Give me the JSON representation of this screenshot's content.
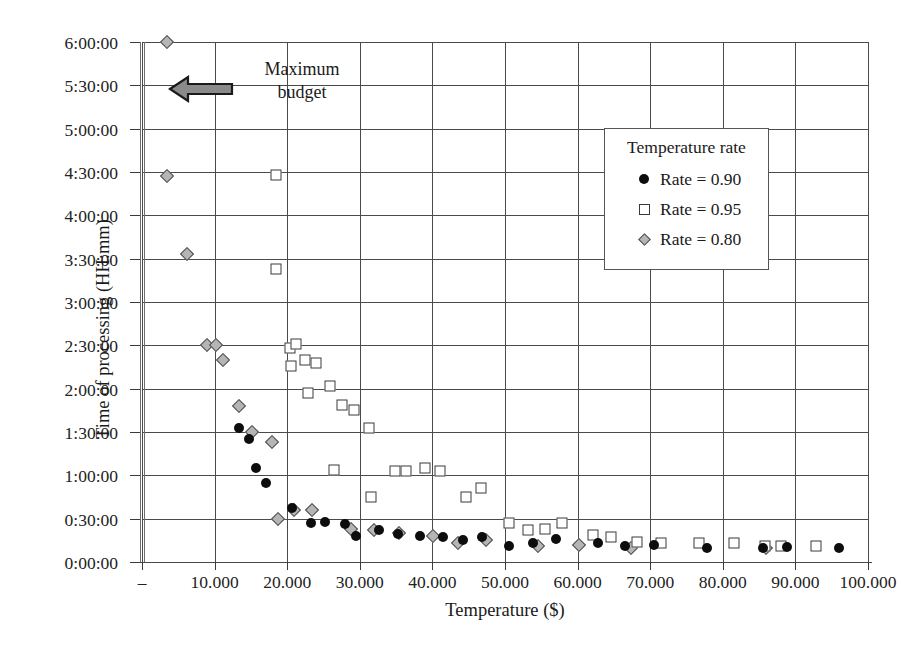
{
  "chart_data": {
    "type": "scatter",
    "title": "",
    "xlabel": "Temperature ($)",
    "ylabel": "Time of processing (HH:mm)",
    "xlim": [
      0,
      100000
    ],
    "ylim": [
      0,
      21600
    ],
    "grid": true,
    "legend_position": "inside-top-right",
    "legend_title": "Temperature rate",
    "x_ticks": [
      0,
      10000,
      20000,
      30000,
      40000,
      50000,
      60000,
      70000,
      80000,
      90000,
      100000
    ],
    "x_tick_labels": [
      "–",
      "10.000",
      "20.000",
      "30.000",
      "40.000",
      "50.000",
      "60.000",
      "70.000",
      "80.000",
      "90.000",
      "100.000"
    ],
    "y_ticks": [
      0,
      1800,
      3600,
      5400,
      7200,
      9000,
      10800,
      12600,
      14400,
      16200,
      18000,
      19800,
      21600
    ],
    "y_tick_labels": [
      "0:00:00",
      "0:30:00",
      "1:00:00",
      "1:30:00",
      "2:00:00",
      "2:30:00",
      "3:00:00",
      "3:30:00",
      "4:00:00",
      "4:30:00",
      "5:00:00",
      "5:30:00",
      "6:00:00"
    ],
    "annotations": [
      {
        "text": "Maximum\nbudget",
        "arrow": "left-arrow",
        "x": 12000,
        "y": 19800
      }
    ],
    "series": [
      {
        "name": "Rate = 0.90",
        "marker": "filled-circle",
        "color": "#0d0d0d",
        "points": [
          [
            13300,
            5580
          ],
          [
            14800,
            5100
          ],
          [
            15700,
            3900
          ],
          [
            17100,
            3300
          ],
          [
            20700,
            2250
          ],
          [
            23300,
            1620
          ],
          [
            25200,
            1680
          ],
          [
            28000,
            1560
          ],
          [
            29500,
            1080
          ],
          [
            32600,
            1320
          ],
          [
            35200,
            1170
          ],
          [
            38300,
            1080
          ],
          [
            41500,
            1020
          ],
          [
            44200,
            900
          ],
          [
            46800,
            1020
          ],
          [
            50500,
            660
          ],
          [
            53800,
            810
          ],
          [
            57000,
            960
          ],
          [
            62800,
            780
          ],
          [
            66500,
            660
          ],
          [
            70500,
            720
          ],
          [
            77800,
            570
          ],
          [
            85600,
            600
          ],
          [
            88800,
            630
          ],
          [
            96000,
            570
          ]
        ]
      },
      {
        "name": "Rate = 0.95",
        "marker": "open-square",
        "color": "#3a3a3a",
        "points": [
          [
            18500,
            16080
          ],
          [
            18500,
            12180
          ],
          [
            20400,
            8880
          ],
          [
            21200,
            9060
          ],
          [
            20500,
            8160
          ],
          [
            22400,
            8400
          ],
          [
            24000,
            8280
          ],
          [
            22800,
            7020
          ],
          [
            25900,
            7320
          ],
          [
            27600,
            6540
          ],
          [
            29200,
            6300
          ],
          [
            31300,
            5580
          ],
          [
            26400,
            3840
          ],
          [
            31500,
            2700
          ],
          [
            34800,
            3780
          ],
          [
            36300,
            3780
          ],
          [
            39000,
            3900
          ],
          [
            41000,
            3780
          ],
          [
            44600,
            2700
          ],
          [
            46700,
            3060
          ],
          [
            50600,
            1620
          ],
          [
            53200,
            1320
          ],
          [
            55500,
            1380
          ],
          [
            57900,
            1620
          ],
          [
            62100,
            1140
          ],
          [
            64600,
            1020
          ],
          [
            68200,
            840
          ],
          [
            71500,
            780
          ],
          [
            76700,
            780
          ],
          [
            81500,
            780
          ],
          [
            85800,
            660
          ],
          [
            88000,
            660
          ],
          [
            92800,
            660
          ]
        ]
      },
      {
        "name": "Rate = 0.80",
        "marker": "gray-diamond",
        "color": "#b5b5b5",
        "points": [
          [
            3400,
            21600
          ],
          [
            3400,
            16020
          ],
          [
            6200,
            12800
          ],
          [
            8900,
            9000
          ],
          [
            10200,
            9000
          ],
          [
            11100,
            8400
          ],
          [
            13300,
            6480
          ],
          [
            15200,
            5400
          ],
          [
            17900,
            4980
          ],
          [
            18700,
            1800
          ],
          [
            20900,
            2160
          ],
          [
            23400,
            2160
          ],
          [
            28800,
            1380
          ],
          [
            32000,
            1320
          ],
          [
            35400,
            1200
          ],
          [
            40100,
            1080
          ],
          [
            43500,
            780
          ],
          [
            47400,
            900
          ],
          [
            54600,
            660
          ],
          [
            60200,
            690
          ],
          [
            67300,
            600
          ],
          [
            86000,
            570
          ]
        ]
      }
    ]
  }
}
